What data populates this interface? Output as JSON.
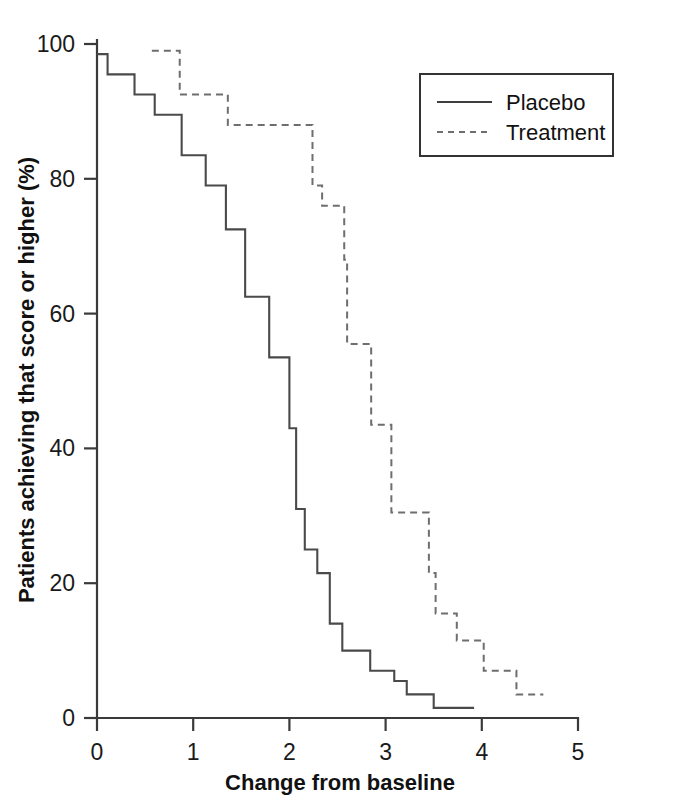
{
  "chart_data": {
    "type": "line",
    "title": "",
    "subtitle": "",
    "xlabel": "Change from baseline",
    "ylabel": "Patients achieving that score or higher (%)",
    "xlim": [
      0,
      5
    ],
    "ylim": [
      0,
      100
    ],
    "xticks": [
      "0",
      "1",
      "2",
      "3",
      "4",
      "5"
    ],
    "xtick_values": [
      0,
      1,
      2,
      3,
      4,
      5
    ],
    "yticks": [
      "0",
      "20",
      "40",
      "60",
      "80",
      "100"
    ],
    "ytick_values": [
      0,
      20,
      40,
      60,
      80,
      100
    ],
    "grid": false,
    "legend_position": "top-right",
    "legend_entries": [
      {
        "label": "Placebo",
        "style": "solid",
        "color": "#3f3f3f"
      },
      {
        "label": "Treatment",
        "style": "dashed",
        "color": "#6e6e6e"
      }
    ],
    "series": [
      {
        "name": "Placebo",
        "style": "solid",
        "color": "#4a4a4a",
        "step": "post",
        "points": [
          [
            0.0,
            98.5
          ],
          [
            0.11,
            98.5
          ],
          [
            0.11,
            95.5
          ],
          [
            0.39,
            95.5
          ],
          [
            0.39,
            92.5
          ],
          [
            0.6,
            92.5
          ],
          [
            0.6,
            89.5
          ],
          [
            0.88,
            89.5
          ],
          [
            0.88,
            83.5
          ],
          [
            1.13,
            83.5
          ],
          [
            1.13,
            79.0
          ],
          [
            1.34,
            79.0
          ],
          [
            1.34,
            72.5
          ],
          [
            1.54,
            72.5
          ],
          [
            1.54,
            62.5
          ],
          [
            1.79,
            62.5
          ],
          [
            1.79,
            53.5
          ],
          [
            2.0,
            53.5
          ],
          [
            2.0,
            43.0
          ],
          [
            2.07,
            43.0
          ],
          [
            2.07,
            31.0
          ],
          [
            2.16,
            31.0
          ],
          [
            2.16,
            25.0
          ],
          [
            2.29,
            25.0
          ],
          [
            2.29,
            21.5
          ],
          [
            2.42,
            21.5
          ],
          [
            2.42,
            14.0
          ],
          [
            2.55,
            14.0
          ],
          [
            2.55,
            10.0
          ],
          [
            2.84,
            10.0
          ],
          [
            2.84,
            7.0
          ],
          [
            3.09,
            7.0
          ],
          [
            3.09,
            5.5
          ],
          [
            3.22,
            5.5
          ],
          [
            3.22,
            3.5
          ],
          [
            3.5,
            3.5
          ],
          [
            3.5,
            1.5
          ],
          [
            3.92,
            1.5
          ]
        ]
      },
      {
        "name": "Treatment",
        "style": "dashed",
        "color": "#6e6e6e",
        "step": "post",
        "points": [
          [
            0.57,
            99.0
          ],
          [
            0.86,
            99.0
          ],
          [
            0.86,
            92.5
          ],
          [
            1.36,
            92.5
          ],
          [
            1.36,
            88.0
          ],
          [
            2.24,
            88.0
          ],
          [
            2.24,
            79.0
          ],
          [
            2.34,
            79.0
          ],
          [
            2.34,
            76.0
          ],
          [
            2.57,
            76.0
          ],
          [
            2.57,
            68.0
          ],
          [
            2.6,
            68.0
          ],
          [
            2.6,
            55.5
          ],
          [
            2.85,
            55.5
          ],
          [
            2.85,
            43.5
          ],
          [
            3.06,
            43.5
          ],
          [
            3.06,
            30.5
          ],
          [
            3.45,
            30.5
          ],
          [
            3.45,
            21.5
          ],
          [
            3.52,
            21.5
          ],
          [
            3.52,
            15.5
          ],
          [
            3.74,
            15.5
          ],
          [
            3.74,
            11.5
          ],
          [
            4.02,
            11.5
          ],
          [
            4.02,
            7.0
          ],
          [
            4.36,
            7.0
          ],
          [
            4.36,
            3.5
          ],
          [
            4.64,
            3.5
          ]
        ]
      }
    ]
  }
}
